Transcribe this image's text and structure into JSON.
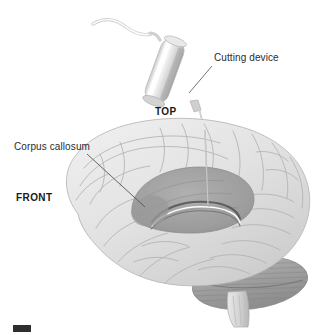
{
  "figure": {
    "background_color": "#ffffff",
    "width": 327,
    "height": 335
  },
  "labels": {
    "cutting_device": "Cutting device",
    "corpus_callosum": "Corpus callosum",
    "top": "TOP",
    "front": "FRONT"
  },
  "icons": {
    "cutting_device_instrument": "surgical-cutting-device",
    "brain": "human-brain-lateral-view",
    "corpus_callosum_structure": "corpus-callosum",
    "cerebellum": "cerebellum",
    "brainstem": "brainstem",
    "probe": "cutting-probe",
    "cable": "device-cable",
    "leader_line_cutting_device": "leader-line",
    "leader_line_corpus_callosum": "leader-line",
    "figure_mark": "figure-label-mark"
  },
  "colors": {
    "text": "#2b2b2b",
    "text_bold": "#1a1a1a",
    "leader_line": "#555555",
    "brain_light": "#e4e4e4",
    "brain_mid": "#cfcfcf",
    "brain_shadow": "#b4b4b4",
    "corpus_callosum": "#a6a6a6",
    "corpus_callosum_dark": "#8a8a8a",
    "cerebellum": "#a9a9a9",
    "cerebellum_dark": "#8f8f8f",
    "brainstem": "#d2d2d2",
    "device_body_light": "#f6f6f6",
    "device_body_mid": "#d8d8d8",
    "device_body_dark": "#a8a8a8",
    "probe": "#bcbcbc",
    "figure_mark": "#2f2f2f"
  }
}
